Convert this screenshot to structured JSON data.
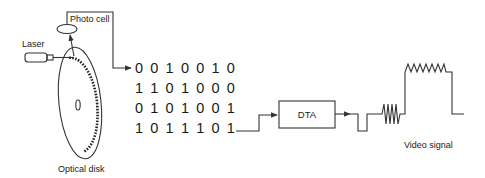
{
  "diagram": {
    "labels": {
      "photo_cell": "Photo cell",
      "laser": "Laser",
      "optical_disk": "Optical disk",
      "dta": "DTA",
      "video_signal": "Video signal"
    },
    "binary_rows": [
      "0010010",
      "1101000",
      "0101001",
      "1011101"
    ],
    "colors": {
      "line": "#333333",
      "text": "#1a1a1a",
      "background": "#ffffff"
    }
  }
}
